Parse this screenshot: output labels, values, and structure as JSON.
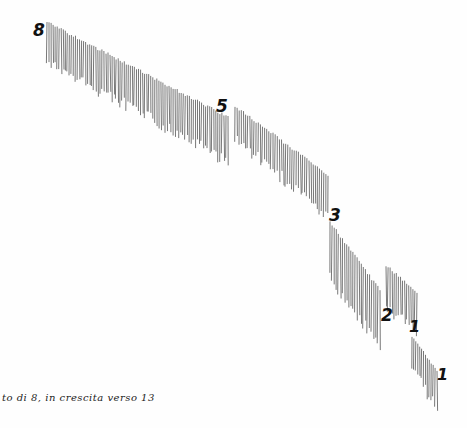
{
  "artwork": {
    "ink_color": "#555555",
    "groups": [
      {
        "label": "8",
        "label_x": 33,
        "label_y": 20,
        "x1": 47,
        "x2": 228,
        "top1": 22,
        "top2": 117,
        "len1": 38,
        "len2": 42,
        "count": 90
      },
      {
        "label": "5",
        "label_x": 216,
        "label_y": 96,
        "x1": 235,
        "x2": 328,
        "top1": 106,
        "top2": 175,
        "len1": 30,
        "len2": 40,
        "count": 45
      },
      {
        "label": "3",
        "label_x": 329,
        "label_y": 205,
        "x1": 330,
        "x2": 380,
        "top1": 222,
        "top2": 290,
        "len1": 55,
        "len2": 55,
        "count": 25
      },
      {
        "label": "",
        "label_x": 0,
        "label_y": 0,
        "x1": 386,
        "x2": 417,
        "top1": 265,
        "top2": 292,
        "len1": 40,
        "len2": 35,
        "count": 16
      },
      {
        "label": "2",
        "label_x": 381,
        "label_y": 305,
        "x1": 0,
        "x2": 0,
        "top1": 0,
        "top2": 0,
        "len1": 0,
        "len2": 0,
        "count": 0
      },
      {
        "label": "1",
        "label_x": 409,
        "label_y": 317,
        "x1": 0,
        "x2": 0,
        "top1": 0,
        "top2": 0,
        "len1": 0,
        "len2": 0,
        "count": 0
      },
      {
        "label": "1",
        "label_x": 437,
        "label_y": 365,
        "x1": 412,
        "x2": 437,
        "top1": 337,
        "top2": 370,
        "len1": 30,
        "len2": 35,
        "count": 14
      }
    ]
  },
  "caption": "to di 8, in crescita verso 13"
}
